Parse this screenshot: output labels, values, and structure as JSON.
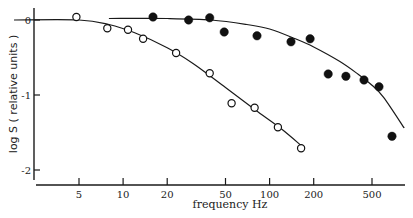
{
  "chart_data": {
    "type": "scatter",
    "title": "",
    "xlabel": "frequency Hz",
    "ylabel": "log S ( relative units )",
    "xscale": "log",
    "xlim": [
      1.7,
      900
    ],
    "ylim": [
      -2.1,
      0.15
    ],
    "grid": false,
    "legend": null,
    "x_ticks": [
      5,
      10,
      20,
      50,
      100,
      200,
      500
    ],
    "x_tick_labels": [
      "5",
      "10",
      "20",
      "50",
      "100",
      "200",
      "500"
    ],
    "y_ticks": [
      0,
      -1,
      -2
    ],
    "y_tick_labels": [
      "0",
      "-1",
      "-2"
    ],
    "series": [
      {
        "name": "open circles",
        "marker": "open-circle",
        "x": [
          4.8,
          7.8,
          10.8,
          13.7,
          23,
          39,
          55,
          79,
          114,
          164
        ],
        "y": [
          0.04,
          -0.11,
          -0.13,
          -0.25,
          -0.44,
          -0.71,
          -1.11,
          -1.17,
          -1.43,
          -1.71
        ],
        "fit_curve": {
          "x": [
            1.8,
            5,
            8,
            12,
            20,
            30,
            50,
            80,
            120,
            170
          ],
          "y": [
            0.0,
            0.0,
            -0.06,
            -0.17,
            -0.37,
            -0.58,
            -0.9,
            -1.2,
            -1.45,
            -1.7
          ]
        }
      },
      {
        "name": "filled circles",
        "marker": "filled-circle",
        "x": [
          16,
          28,
          39,
          49,
          82,
          140,
          189,
          251,
          332,
          441,
          558,
          685
        ],
        "y": [
          0.04,
          0.0,
          0.03,
          -0.16,
          -0.21,
          -0.29,
          -0.25,
          -0.72,
          -0.75,
          -0.8,
          -0.89,
          -1.55
        ],
        "fit_curve": {
          "x": [
            8,
            20,
            40,
            70,
            100,
            150,
            200,
            300,
            400,
            500,
            600,
            830
          ],
          "y": [
            0.02,
            0.02,
            0.0,
            -0.06,
            -0.12,
            -0.25,
            -0.36,
            -0.55,
            -0.72,
            -0.87,
            -1.03,
            -1.44
          ]
        }
      }
    ]
  }
}
